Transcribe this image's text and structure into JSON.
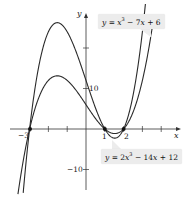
{
  "chart_data": {
    "type": "line",
    "title": "",
    "xlabel": "x",
    "ylabel": "y",
    "xlim": [
      -4.5,
      5
    ],
    "ylim": [
      -17,
      32
    ],
    "grid": false,
    "x_ticks": [
      -3,
      -2,
      -1,
      1,
      2,
      3,
      4
    ],
    "x_tick_labels": [
      "-3",
      "1",
      "2"
    ],
    "y_ticks": [
      -10,
      10,
      20
    ],
    "y_tick_labels": [
      "10",
      "-10"
    ],
    "series": [
      {
        "name": "y = x^3 - 7x + 6",
        "formula": "x^3 - 7x + 6",
        "roots": [
          -3,
          1,
          2
        ],
        "local_max": [
          -1.53,
          13.1
        ],
        "local_min": [
          1.53,
          -0.13
        ]
      },
      {
        "name": "y = 2x^3 - 14x + 12",
        "formula": "2x^3 - 14x + 12",
        "roots": [
          -3,
          1,
          2
        ],
        "local_max": [
          -1.53,
          26.3
        ],
        "local_min": [
          1.53,
          -0.26
        ]
      }
    ],
    "points": [
      [
        -3,
        0
      ],
      [
        1,
        0
      ],
      [
        2,
        0
      ]
    ],
    "annotations": [
      "y = x^3 - 7x + 6",
      "y = 2x^3 - 14x + 12"
    ]
  },
  "labels": {
    "x_axis": "x",
    "y_axis": "y",
    "tick_neg3": "−3",
    "tick_1": "1",
    "tick_2": "2",
    "tick_10": "10",
    "tick_neg10": "−10",
    "callout_top": {
      "lhs": "y",
      "eq": " = ",
      "x": "x",
      "exp": "3",
      "rest1": " − 7",
      "x2": "x",
      "rest2": " + 6"
    },
    "callout_bottom": {
      "lhs": "y",
      "eq": " = 2",
      "x": "x",
      "exp": "3",
      "rest1": " − 14",
      "x2": "x",
      "rest2": " + 12"
    }
  },
  "colors": {
    "curve": "#2a2a2a",
    "axis": "#333333",
    "callout_bg": "#ececec"
  }
}
